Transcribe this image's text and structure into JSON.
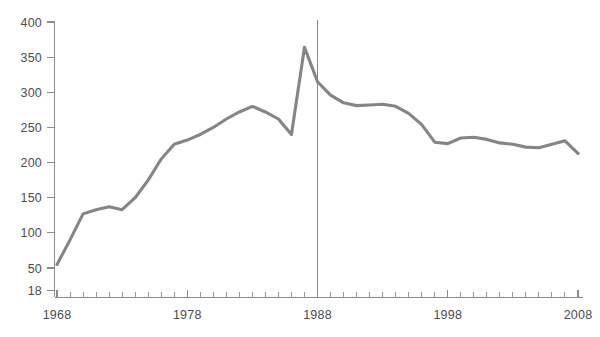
{
  "chart_data": {
    "type": "line",
    "title": "",
    "subtitle": "",
    "xlabel": "",
    "ylabel": "",
    "xlim": [
      1968,
      2008
    ],
    "ylim": [
      18,
      400
    ],
    "grid": false,
    "legend": false,
    "legend_position": "none",
    "y_ticks": [
      18,
      50,
      100,
      150,
      200,
      250,
      300,
      350,
      400
    ],
    "y_tick_labels": [
      "18",
      "50",
      "100",
      "150",
      "200",
      "250",
      "300",
      "350",
      "400"
    ],
    "x_ticks": [
      1968,
      1978,
      1988,
      1998,
      2008
    ],
    "x_tick_labels": [
      "1968",
      "1978",
      "1988",
      "1998",
      "2008"
    ],
    "x_minor_tick_interval": 1,
    "annotations": [
      {
        "name": "reference-line-1988",
        "type": "vline",
        "x": 1988,
        "label": ""
      }
    ],
    "series": [
      {
        "name": "series-1",
        "color": "#858585",
        "x": [
          1968,
          1969,
          1970,
          1971,
          1972,
          1973,
          1974,
          1975,
          1976,
          1977,
          1978,
          1979,
          1980,
          1981,
          1982,
          1983,
          1984,
          1985,
          1986,
          1987,
          1988,
          1989,
          1990,
          1991,
          1992,
          1993,
          1994,
          1995,
          1996,
          1997,
          1998,
          1999,
          2000,
          2001,
          2002,
          2003,
          2004,
          2005,
          2006,
          2007,
          2008
        ],
        "values": [
          55,
          90,
          127,
          133,
          137,
          133,
          150,
          175,
          205,
          226,
          232,
          240,
          250,
          262,
          272,
          280,
          272,
          262,
          240,
          364,
          315,
          296,
          285,
          281,
          282,
          283,
          280,
          270,
          254,
          229,
          227,
          235,
          236,
          233,
          228,
          226,
          222,
          221,
          226,
          231,
          213
        ]
      }
    ]
  },
  "colors": {
    "line": "#858585",
    "axis": "#8c8c8c",
    "text": "#4d4d4d",
    "background": "#ffffff"
  }
}
